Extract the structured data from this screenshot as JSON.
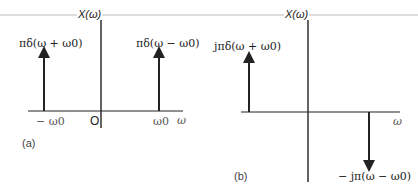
{
  "figure": {
    "top_rule_color": "#bbbbbb",
    "axis_color": "#222222",
    "panel_a": {
      "caption": "(a)",
      "y_axis_label": "X(ω)",
      "x_axis_label": "ω",
      "origin_label": "O",
      "tick_labels": [
        "− ω0",
        "ω0"
      ],
      "impulses": [
        {
          "position": "−ω0",
          "direction": "up",
          "label": "πδ(ω + ω0)"
        },
        {
          "position": "ω0",
          "direction": "up",
          "label": "πδ(ω − ω0)"
        }
      ]
    },
    "panel_b": {
      "caption": "(b)",
      "y_axis_label": "X(ω)",
      "x_axis_label": "ω",
      "impulses": [
        {
          "position": "−ω0",
          "direction": "up",
          "label": "jπδ(ω + ω0)"
        },
        {
          "position": "ω0",
          "direction": "down",
          "label": "− jπ(ω − ω0)"
        }
      ]
    }
  }
}
